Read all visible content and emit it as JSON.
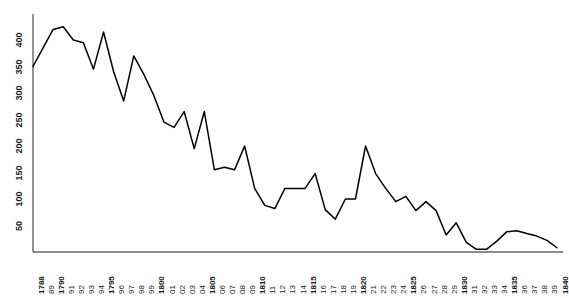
{
  "chart_data": {
    "type": "line",
    "title": "",
    "subtitle": "",
    "xlabel": "",
    "ylabel": "",
    "grid": false,
    "legend": "none",
    "line_color": "#000000",
    "axis_color": "#555555",
    "xlim": [
      1788,
      1840
    ],
    "ylim": [
      0,
      430
    ],
    "yticks": [
      50,
      100,
      150,
      200,
      250,
      300,
      350,
      400
    ],
    "ytick_labels": [
      "50",
      "100",
      "150",
      "200",
      "250",
      "300",
      "350",
      "400"
    ],
    "x": [
      1788,
      1789,
      1790,
      1791,
      1792,
      1793,
      1794,
      1795,
      1796,
      1797,
      1798,
      1799,
      1800,
      1801,
      1802,
      1803,
      1804,
      1805,
      1806,
      1807,
      1808,
      1809,
      1810,
      1811,
      1812,
      1813,
      1814,
      1815,
      1816,
      1817,
      1818,
      1819,
      1820,
      1821,
      1822,
      1823,
      1824,
      1825,
      1826,
      1827,
      1828,
      1829,
      1830,
      1831,
      1832,
      1833,
      1834,
      1835,
      1836,
      1837,
      1838,
      1839,
      1840
    ],
    "xtick_labels": [
      "1788",
      "89",
      "1790",
      "91",
      "92",
      "93",
      "94",
      "1795",
      "96",
      "97",
      "98",
      "99",
      "1800",
      "01",
      "02",
      "03",
      "04",
      "1805",
      "06",
      "07",
      "08",
      "09",
      "1810",
      "11",
      "12",
      "13",
      "14",
      "1815",
      "16",
      "17",
      "18",
      "19",
      "1820",
      "21",
      "22",
      "23",
      "24",
      "1825",
      "26",
      "27",
      "28",
      "29",
      "1830",
      "31",
      "32",
      "33",
      "34",
      "1835",
      "36",
      "37",
      "38",
      "39",
      "1840"
    ],
    "xtick_bold": [
      true,
      false,
      true,
      false,
      false,
      false,
      false,
      true,
      false,
      false,
      false,
      false,
      true,
      false,
      false,
      false,
      false,
      true,
      false,
      false,
      false,
      false,
      true,
      false,
      false,
      false,
      false,
      true,
      false,
      false,
      false,
      false,
      true,
      false,
      false,
      false,
      false,
      true,
      false,
      false,
      false,
      false,
      true,
      false,
      false,
      false,
      false,
      true,
      false,
      false,
      false,
      false,
      true
    ],
    "values": [
      350,
      385,
      420,
      425,
      400,
      395,
      345,
      415,
      340,
      285,
      370,
      335,
      295,
      245,
      235,
      265,
      195,
      265,
      155,
      160,
      155,
      200,
      120,
      88,
      82,
      120,
      120,
      120,
      148,
      80,
      62,
      100,
      100,
      200,
      148,
      120,
      95,
      105,
      78,
      95,
      78,
      32,
      55,
      18,
      5,
      5,
      20,
      38,
      40,
      35,
      30,
      22,
      8
    ],
    "series_name": "series-1"
  },
  "axes": {
    "y_axis_name": "y-axis",
    "x_axis_name": "x-axis"
  }
}
